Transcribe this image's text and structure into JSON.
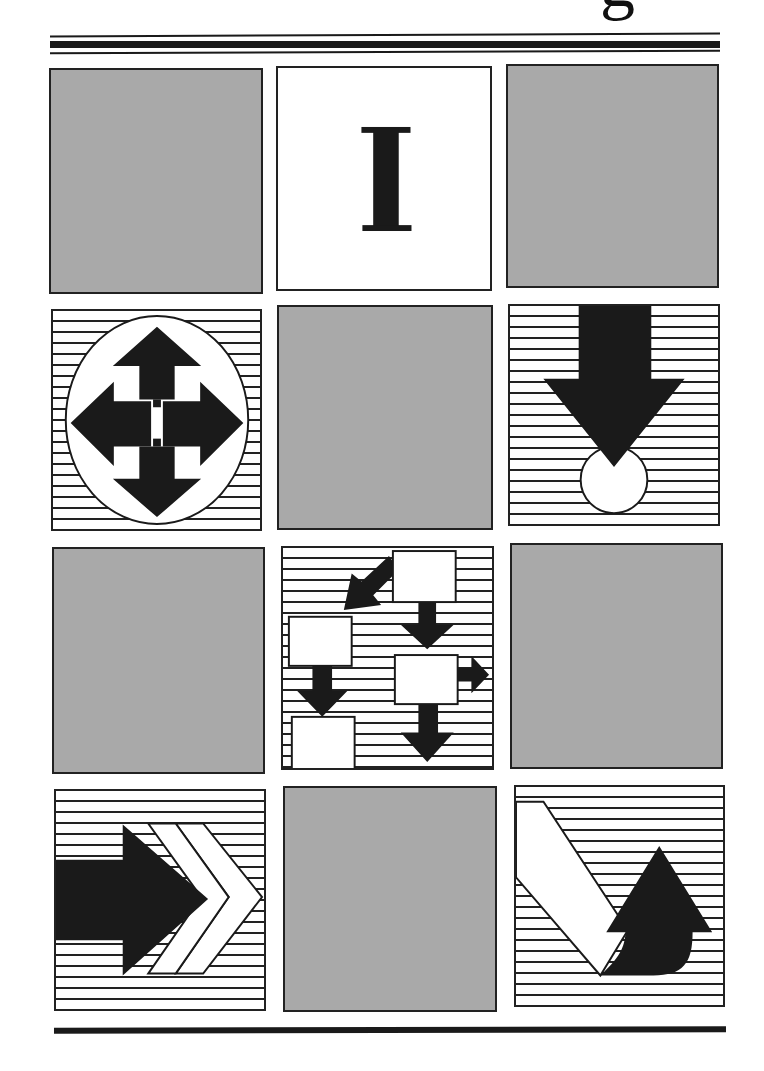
{
  "page": {
    "title_fragment": "g",
    "colors": {
      "ink": "#1a1a1a",
      "panel_gray": "#a9a9a9",
      "paper": "#ffffff"
    }
  },
  "grid": {
    "rows": 4,
    "columns": 3,
    "panels": [
      {
        "row": 1,
        "col": 1,
        "type": "blank-gray"
      },
      {
        "row": 1,
        "col": 2,
        "type": "i-beam-cursor-icon",
        "glyph": "I"
      },
      {
        "row": 1,
        "col": 3,
        "type": "blank-gray"
      },
      {
        "row": 2,
        "col": 1,
        "type": "four-way-move-arrows-icon"
      },
      {
        "row": 2,
        "col": 2,
        "type": "blank-gray"
      },
      {
        "row": 2,
        "col": 3,
        "type": "down-arrow-into-circle-icon"
      },
      {
        "row": 3,
        "col": 1,
        "type": "blank-gray"
      },
      {
        "row": 3,
        "col": 2,
        "type": "flowchart-boxes-arrows-icon"
      },
      {
        "row": 3,
        "col": 3,
        "type": "blank-gray"
      },
      {
        "row": 4,
        "col": 1,
        "type": "right-arrow-chevrons-icon"
      },
      {
        "row": 4,
        "col": 2,
        "type": "blank-gray"
      },
      {
        "row": 4,
        "col": 3,
        "type": "curved-up-arrow-icon"
      }
    ]
  }
}
